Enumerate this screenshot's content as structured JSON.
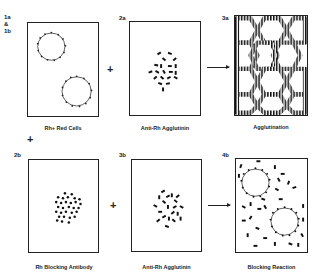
{
  "diagram": {
    "rows": [
      {
        "panels": [
          {
            "id": "1a",
            "tag_lines": [
              "1a",
              "&",
              "1b"
            ],
            "caption": "Rh+ Red Cells",
            "content": "two-red-cells-with-antigen-sites"
          },
          {
            "id": "2a",
            "tag_lines": [
              "2a"
            ],
            "caption": "Anti-Rh Agglutinin",
            "content": "scattered-agglutinin-antibodies"
          },
          {
            "id": "3a",
            "tag_lines": [
              "3a"
            ],
            "caption": "Agglutination",
            "content": "honeycomb-of-cross-linked-cells"
          }
        ],
        "operators": [
          "+",
          "→"
        ]
      },
      {
        "panels": [
          {
            "id": "2b",
            "tag_lines": [
              "2b"
            ],
            "caption": "Rh Blocking Antibody",
            "content": "scattered-blocking-antibodies"
          },
          {
            "id": "3b",
            "tag_lines": [
              "3b"
            ],
            "caption": "Anti-Rh Agglutinin",
            "content": "scattered-agglutinin-antibodies"
          },
          {
            "id": "4b",
            "tag_lines": [
              "4b"
            ],
            "caption": "Blocking Reaction",
            "content": "blocked-cells-with-free-agglutinin"
          }
        ],
        "operators": [
          "+",
          "→"
        ]
      }
    ],
    "vertical_operator": "+"
  }
}
